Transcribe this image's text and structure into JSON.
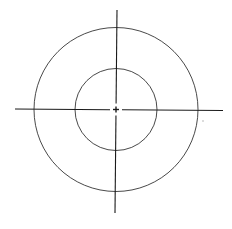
{
  "diagram": {
    "type": "concentric-circles-with-crosshair",
    "width": 232,
    "height": 229,
    "background": "#ffffff",
    "stroke_color": "#1a1a1a",
    "center": {
      "x": 116,
      "y": 109.5
    },
    "circles": [
      {
        "name": "outer-circle",
        "r": 82,
        "stroke_width": 0.8
      },
      {
        "name": "inner-circle",
        "r": 41,
        "stroke_width": 0.8
      }
    ],
    "axes": {
      "horizontal": {
        "x1": 15,
        "y1": 109,
        "x2": 223,
        "y2": 110.5,
        "stroke_width": 1.1
      },
      "vertical": {
        "x1": 117,
        "y1": 10,
        "x2": 115,
        "y2": 213,
        "stroke_width": 1.1
      }
    },
    "center_mark": {
      "size": 3,
      "gap": 6
    },
    "artifact_dot": {
      "x": 203,
      "y": 121,
      "r": 0.8,
      "color": "#b0b0b0"
    }
  }
}
